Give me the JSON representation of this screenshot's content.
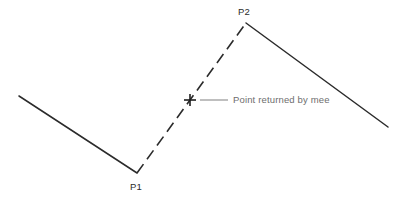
{
  "canvas": {
    "width": 404,
    "height": 203,
    "background_color": "#ffffff"
  },
  "style": {
    "solid_stroke_color": "#2b2b2b",
    "dashed_stroke_color": "#2b2b2b",
    "leader_line_color": "#8a8a8a",
    "marker_color": "#1f1f1f",
    "vertex_label_color": "#2b2b2b",
    "callout_label_color": "#6e6e6e",
    "solid_stroke_width": 1.5,
    "dashed_stroke_width": 1.6,
    "dash_pattern": "11 6",
    "leader_stroke_width": 1.1,
    "marker_stroke_width": 1.6
  },
  "geometry": {
    "left_segment": {
      "start_x": 19,
      "start_y": 96,
      "end_x": 137,
      "end_y": 173
    },
    "dashed_segment": {
      "start_x": 137,
      "start_y": 173,
      "end_x": 246,
      "end_y": 23
    },
    "right_segment": {
      "start_x": 246,
      "start_y": 23,
      "end_x": 388,
      "end_y": 127
    },
    "cross_marker": {
      "center_x": 190,
      "center_y": 100,
      "arm_length": 6
    },
    "leader_line": {
      "start_x": 200,
      "start_y": 100,
      "end_x": 228,
      "end_y": 100
    }
  },
  "labels": {
    "p1": {
      "text": "P1",
      "x": 130,
      "y": 190
    },
    "p2": {
      "text": "P2",
      "x": 238,
      "y": 15
    },
    "callout": {
      "text": "Point returned by mee",
      "x": 233,
      "y": 103
    }
  }
}
